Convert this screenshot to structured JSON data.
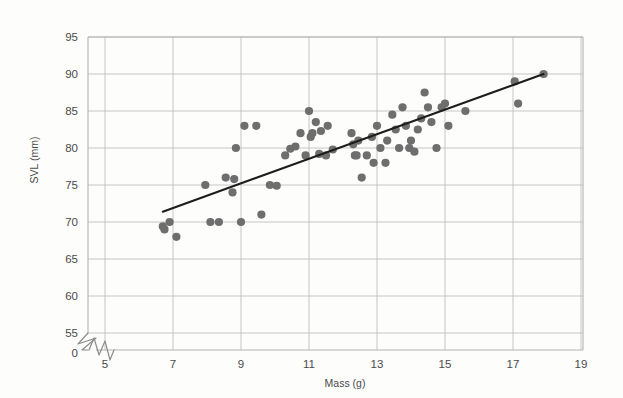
{
  "chart_data": {
    "type": "scatter",
    "title": "",
    "xlabel": "Mass (g)",
    "ylabel": "SVL (mm)",
    "xlim": [
      5,
      19
    ],
    "ylim": [
      55,
      95
    ],
    "xticks": [
      5,
      7,
      9,
      11,
      13,
      15,
      17,
      19
    ],
    "yticks": [
      55,
      60,
      65,
      70,
      75,
      80,
      85,
      90,
      95
    ],
    "xtick_labels": [
      "5",
      "7",
      "9",
      "11",
      "13",
      "15",
      "17",
      "19"
    ],
    "ytick_labels": [
      "55",
      "60",
      "65",
      "70",
      "75",
      "80",
      "85",
      "90",
      "95"
    ],
    "y_origin_label": "0",
    "y_axis_break": true,
    "x_axis_break": true,
    "grid": true,
    "legend": false,
    "point_color": "#6e6e6e",
    "line_color": "#1d1d1d",
    "grid_color": "#bfbfbf",
    "background_color": "#fdfdfc",
    "series": [
      {
        "name": "lizards",
        "x": [
          6.7,
          6.75,
          6.9,
          7.1,
          7.95,
          8.1,
          8.35,
          8.55,
          8.75,
          8.8,
          8.85,
          9.0,
          9.1,
          9.45,
          9.6,
          9.85,
          10.05,
          10.3,
          10.45,
          10.6,
          10.75,
          10.9,
          11.0,
          11.05,
          11.1,
          11.2,
          11.3,
          11.35,
          11.5,
          11.55,
          11.7,
          12.25,
          12.3,
          12.35,
          12.4,
          12.45,
          12.55,
          12.7,
          12.85,
          12.9,
          13.0,
          13.1,
          13.25,
          13.3,
          13.45,
          13.55,
          13.65,
          13.75,
          13.85,
          13.95,
          14.0,
          14.1,
          14.2,
          14.3,
          14.4,
          14.5,
          14.6,
          14.75,
          14.9,
          15.0,
          15.1,
          15.6,
          17.05,
          17.15,
          17.9
        ],
        "y": [
          69.4,
          69.0,
          70.0,
          68.0,
          75.0,
          70.0,
          70.0,
          76.0,
          74.0,
          75.8,
          80.0,
          70.0,
          83.0,
          83.0,
          71.0,
          75.0,
          74.9,
          79.0,
          79.9,
          80.2,
          82.0,
          79.0,
          85.0,
          81.5,
          82.0,
          83.5,
          79.2,
          82.3,
          79.0,
          83.0,
          79.8,
          82.0,
          80.5,
          79.0,
          79.0,
          81.0,
          76.0,
          79.0,
          81.5,
          78.0,
          83.0,
          80.0,
          78.0,
          81.0,
          84.5,
          82.5,
          80.0,
          85.5,
          83.0,
          80.0,
          81.0,
          79.5,
          82.5,
          84.0,
          87.5,
          85.5,
          83.5,
          80.0,
          85.5,
          86.0,
          83.0,
          85.0,
          89.0,
          86.0,
          90.0
        ]
      }
    ],
    "trendline": {
      "name": "least-squares fit",
      "x_start": 6.7,
      "y_start": 71.4,
      "x_end": 17.9,
      "y_end": 90.0
    }
  },
  "axes": {
    "y_axis_title": "SVL (mm)",
    "x_axis_title": "Mass (g)"
  }
}
